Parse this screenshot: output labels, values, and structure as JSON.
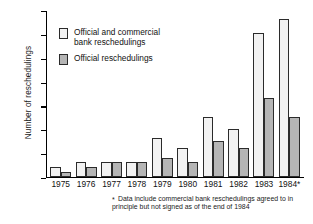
{
  "chart_data": {
    "type": "bar",
    "title": "",
    "xlabel": "",
    "ylabel": "Number of reschedulings",
    "ylim": [
      0,
      35
    ],
    "yticks": [
      0,
      5,
      10,
      15,
      20,
      25,
      30,
      35
    ],
    "grid": false,
    "legend_position": "inside-top-left",
    "categories": [
      "1975",
      "1976",
      "1977",
      "1978",
      "1979",
      "1980",
      "1981",
      "1982",
      "1983",
      "1984*"
    ],
    "series": [
      {
        "name": "Official and commercial bank reschedulings",
        "values": [
          2,
          3,
          3,
          3,
          8,
          6,
          12.5,
          10,
          30,
          33
        ]
      },
      {
        "name": "Official reschedulings",
        "values": [
          1,
          2,
          3,
          3,
          4,
          3,
          7.5,
          6,
          16.5,
          12.5
        ]
      }
    ],
    "annotations": [
      "* Data include commercial bank reschedulings agreed to in principle but not signed as of the end of 1984"
    ]
  },
  "axis": {
    "y_title": "Number of reschedulings",
    "y_tick_labels": [
      "35",
      "30",
      "25",
      "20",
      "15",
      "10",
      "5",
      "0"
    ],
    "x_tick_labels": [
      "1975",
      "1976",
      "1977",
      "1978",
      "1979",
      "1980",
      "1981",
      "1982",
      "1983",
      "1984*"
    ]
  },
  "legend": {
    "items": [
      {
        "label": "Official and commercial\nbank reschedulings",
        "swatch": "light"
      },
      {
        "label": "Official reschedulings",
        "swatch": "dark"
      }
    ]
  },
  "footnote": {
    "marker": "*",
    "text": "Data include commercial bank reschedulings agreed to in principle but not signed as of the end of 1984"
  },
  "colors": {
    "light_bar": "#f2f2f2",
    "dark_bar": "#b5b5b5",
    "axis": "#000000",
    "text": "#111111",
    "background": "#ffffff"
  }
}
